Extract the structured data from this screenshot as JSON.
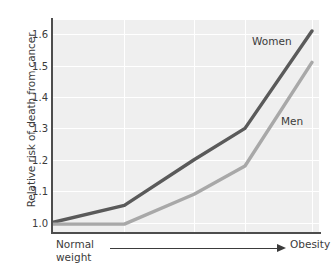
{
  "chart_data": {
    "type": "line",
    "title": "",
    "xlabel": "",
    "ylabel": "Relative risk of death from cancer",
    "ylim": [
      0.97,
      1.645
    ],
    "yticks": [
      1.0,
      1.1,
      1.2,
      1.3,
      1.4,
      1.5,
      1.6
    ],
    "ytick_labels": [
      "1.0",
      "1.1",
      "1.2",
      "1.3",
      "1.4",
      "1.5",
      "1.6"
    ],
    "grid": true,
    "legend_position": "inline-annotation",
    "x_axis_note": {
      "left_label_line1": "Normal",
      "left_label_line2": "weight",
      "right_label": "Obesity",
      "arrow": "left-to-right"
    },
    "x": [
      0,
      27,
      53,
      72,
      97
    ],
    "series": [
      {
        "name": "Women",
        "color": "#5a5a5a",
        "values": [
          1.0,
          1.055,
          1.2,
          1.3,
          1.61
        ]
      },
      {
        "name": "Men",
        "color": "#a8a8a8",
        "values": [
          0.995,
          0.995,
          1.09,
          1.18,
          1.51
        ]
      }
    ],
    "colors": {
      "plot_background": "#efefef",
      "gridline": "#ffffff",
      "axis": "#4d4d4d",
      "text": "#3b3b3b"
    }
  },
  "annotations": {
    "women_label": "Women",
    "men_label": "Men"
  }
}
